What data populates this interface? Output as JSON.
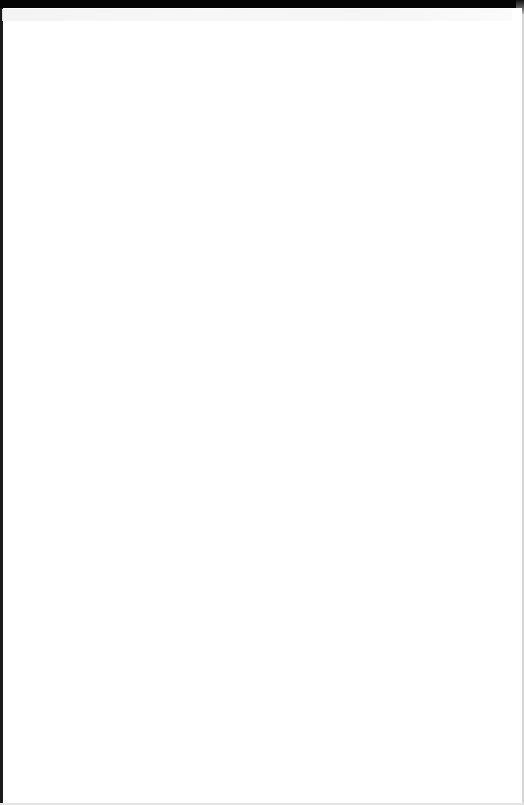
{
  "window": {
    "state": "blank",
    "colors": {
      "top_bar": "#050505",
      "left_edge": "#1a1a1a",
      "right_edge": "#d6d6d6",
      "content_background": "#ffffff",
      "ghost_strip": "#f4f4f4"
    }
  },
  "content": {
    "text": ""
  }
}
